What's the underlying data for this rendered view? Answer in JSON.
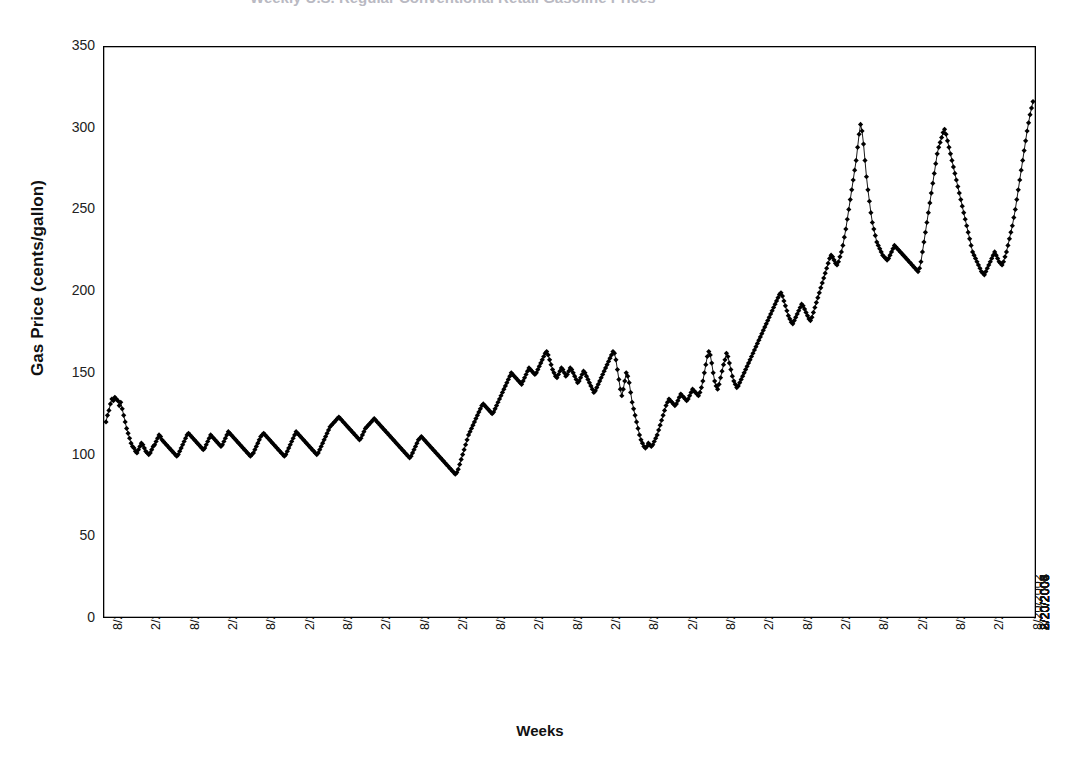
{
  "title_fragment": "Weekly U.S. Regular Conventional Retail Gasoline Prices",
  "axes": {
    "ylabel": "Gas Price (cents/gallon)",
    "xlabel": "Weeks",
    "yticks": [
      "0",
      "50",
      "100",
      "150",
      "200",
      "250",
      "300",
      "350"
    ],
    "ylim": [
      0,
      350
    ],
    "xticks": [
      "8/20/1990",
      "2/20/1991",
      "8/20/1991",
      "2/20/1992",
      "8/20/1992",
      "2/20/1993",
      "8/20/1993",
      "2/20/1994",
      "8/20/1994",
      "2/20/1995",
      "8/20/1995",
      "2/20/1996",
      "8/20/1996",
      "2/20/1997",
      "8/20/1997",
      "2/20/1998",
      "8/20/1998",
      "2/20/1999",
      "8/20/1999",
      "2/20/2000",
      "8/20/2000",
      "2/20/2001",
      "8/20/2001",
      "2/20/2002",
      "8/20/2002",
      "2/20/2003",
      "8/20/2003",
      "2/20/2004",
      "8/20/2004",
      "2/20/2005",
      "8/20/2005",
      "2/20/2006",
      "8/20/2006",
      "2/20/2007"
    ]
  },
  "style": {
    "line_color": "#000000",
    "marker_color": "#000000",
    "marker_shape": "diamond",
    "axis_color": "#000000",
    "background": "#ffffff"
  },
  "chart_data": {
    "type": "line",
    "title": "Weekly U.S. Regular Conventional Retail Gasoline Prices",
    "xlabel": "Weeks",
    "ylabel": "Gas Price (cents/gallon)",
    "ylim": [
      0,
      350
    ],
    "xlim": [
      "8/20/1990",
      "7/2007"
    ],
    "grid": false,
    "legend": null,
    "x_tick_interval_weeks": 26,
    "series": [
      {
        "name": "Gas Price (cents/gallon)",
        "x_start": "8/20/1990",
        "x_step": "1 week",
        "values": [
          120,
          124,
          127,
          131,
          134,
          133,
          135,
          134,
          133,
          130,
          132,
          128,
          124,
          120,
          116,
          113,
          110,
          107,
          105,
          104,
          102,
          101,
          103,
          105,
          107,
          106,
          104,
          102,
          101,
          100,
          101,
          103,
          105,
          106,
          108,
          110,
          112,
          111,
          109,
          108,
          107,
          106,
          105,
          104,
          103,
          102,
          101,
          100,
          99,
          100,
          102,
          104,
          106,
          108,
          110,
          112,
          113,
          112,
          111,
          110,
          109,
          108,
          107,
          106,
          105,
          104,
          103,
          104,
          106,
          108,
          110,
          112,
          111,
          110,
          109,
          108,
          107,
          106,
          105,
          106,
          108,
          110,
          112,
          114,
          113,
          112,
          111,
          110,
          109,
          108,
          107,
          106,
          105,
          104,
          103,
          102,
          101,
          100,
          99,
          100,
          101,
          103,
          105,
          107,
          109,
          111,
          112,
          113,
          112,
          111,
          110,
          109,
          108,
          107,
          106,
          105,
          104,
          103,
          102,
          101,
          100,
          99,
          100,
          102,
          104,
          106,
          108,
          110,
          112,
          114,
          113,
          112,
          111,
          110,
          109,
          108,
          107,
          106,
          105,
          104,
          103,
          102,
          101,
          100,
          101,
          103,
          105,
          107,
          109,
          111,
          113,
          115,
          117,
          118,
          119,
          120,
          121,
          122,
          123,
          122,
          121,
          120,
          119,
          118,
          117,
          116,
          115,
          114,
          113,
          112,
          111,
          110,
          109,
          110,
          112,
          114,
          116,
          117,
          118,
          119,
          120,
          121,
          122,
          121,
          120,
          119,
          118,
          117,
          116,
          115,
          114,
          113,
          112,
          111,
          110,
          109,
          108,
          107,
          106,
          105,
          104,
          103,
          102,
          101,
          100,
          99,
          98,
          99,
          101,
          103,
          105,
          107,
          109,
          110,
          111,
          110,
          109,
          108,
          107,
          106,
          105,
          104,
          103,
          102,
          101,
          100,
          99,
          98,
          97,
          96,
          95,
          94,
          93,
          92,
          91,
          90,
          89,
          88,
          89,
          91,
          94,
          97,
          100,
          103,
          106,
          109,
          112,
          114,
          116,
          118,
          120,
          122,
          124,
          126,
          128,
          130,
          131,
          130,
          129,
          128,
          127,
          126,
          125,
          126,
          128,
          130,
          132,
          134,
          136,
          138,
          140,
          142,
          144,
          146,
          148,
          150,
          149,
          148,
          147,
          146,
          145,
          144,
          143,
          145,
          147,
          149,
          151,
          153,
          152,
          151,
          150,
          149,
          150,
          152,
          154,
          156,
          158,
          160,
          162,
          163,
          161,
          158,
          155,
          152,
          150,
          148,
          147,
          149,
          151,
          153,
          152,
          150,
          148,
          149,
          151,
          153,
          152,
          150,
          148,
          146,
          144,
          145,
          147,
          149,
          151,
          150,
          148,
          146,
          144,
          142,
          140,
          138,
          139,
          141,
          143,
          145,
          147,
          149,
          151,
          153,
          155,
          157,
          159,
          161,
          163,
          162,
          158,
          152,
          146,
          140,
          136,
          140,
          145,
          150,
          148,
          144,
          138,
          132,
          128,
          124,
          120,
          116,
          112,
          109,
          107,
          105,
          104,
          105,
          107,
          106,
          105,
          106,
          108,
          110,
          112,
          115,
          118,
          121,
          124,
          127,
          130,
          132,
          134,
          133,
          132,
          131,
          130,
          131,
          133,
          135,
          137,
          136,
          135,
          134,
          133,
          134,
          136,
          138,
          140,
          139,
          138,
          137,
          136,
          138,
          141,
          145,
          150,
          155,
          160,
          163,
          161,
          156,
          150,
          145,
          142,
          140,
          143,
          147,
          151,
          155,
          158,
          162,
          160,
          156,
          152,
          148,
          145,
          143,
          141,
          142,
          144,
          146,
          148,
          150,
          152,
          154,
          156,
          158,
          160,
          162,
          164,
          166,
          168,
          170,
          172,
          174,
          176,
          178,
          180,
          182,
          184,
          186,
          188,
          190,
          192,
          194,
          196,
          198,
          199,
          197,
          194,
          191,
          188,
          185,
          183,
          181,
          180,
          182,
          184,
          186,
          188,
          190,
          192,
          191,
          189,
          187,
          185,
          183,
          182,
          184,
          187,
          190,
          193,
          196,
          199,
          202,
          205,
          208,
          211,
          214,
          217,
          220,
          222,
          221,
          219,
          217,
          216,
          218,
          221,
          224,
          228,
          233,
          238,
          244,
          250,
          256,
          262,
          268,
          274,
          280,
          288,
          296,
          302,
          298,
          290,
          280,
          270,
          262,
          255,
          248,
          242,
          238,
          234,
          230,
          228,
          226,
          224,
          222,
          221,
          220,
          219,
          220,
          222,
          224,
          226,
          228,
          227,
          226,
          225,
          224,
          223,
          222,
          221,
          220,
          219,
          218,
          217,
          216,
          215,
          214,
          213,
          212,
          214,
          218,
          224,
          230,
          236,
          242,
          248,
          254,
          260,
          266,
          272,
          278,
          284,
          288,
          291,
          294,
          297,
          299,
          296,
          292,
          288,
          284,
          280,
          276,
          272,
          268,
          264,
          260,
          256,
          252,
          248,
          244,
          240,
          236,
          232,
          228,
          224,
          222,
          220,
          218,
          216,
          214,
          212,
          211,
          210,
          212,
          214,
          216,
          218,
          220,
          222,
          224,
          222,
          220,
          218,
          217,
          216,
          218,
          221,
          224,
          228,
          232,
          236,
          240,
          245,
          250,
          256,
          262,
          268,
          274,
          280,
          286,
          292,
          298,
          303,
          308,
          312,
          316
        ]
      }
    ],
    "annotations": [
      {
        "label": "Gulf War spike",
        "approx_date": "10/1990",
        "approx_value": 135
      },
      {
        "label": "Late-1990s low",
        "approx_date": "2/1999",
        "approx_value": 88
      },
      {
        "label": "2001 peak",
        "approx_date": "5/2001",
        "approx_value": 163
      },
      {
        "label": "Post-9/11 trough",
        "approx_date": "12/2001",
        "approx_value": 105
      },
      {
        "label": "Hurricane Katrina peak",
        "approx_date": "9/2005",
        "approx_value": 302
      },
      {
        "label": "Summer 2006 peak",
        "approx_date": "8/2006",
        "approx_value": 299
      },
      {
        "label": "Final observation",
        "approx_date": "7/2007",
        "approx_value": 316
      }
    ]
  }
}
